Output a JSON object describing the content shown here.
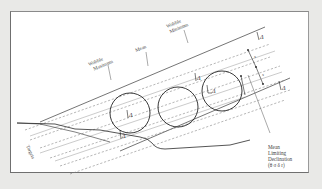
{
  "diagram": {
    "labels": {
      "wobble_maximum": [
        "Wobble",
        "Maximum"
      ],
      "mean": "Mean",
      "wobble_minimum": [
        "Wobble",
        "Minimum"
      ],
      "targets": "Targets",
      "mean_limiting_declination": [
        "Mean",
        "Limiting",
        "Declination",
        "(θ σ δ r)"
      ]
    },
    "symbols": {
      "delta": "Δ",
      "spacing": "s"
    },
    "circles": [
      {
        "cx": 130,
        "cy": 113,
        "r": 20
      },
      {
        "cx": 178,
        "cy": 107,
        "r": 20
      },
      {
        "cx": 222,
        "cy": 91,
        "r": 20
      }
    ],
    "colors": {
      "background": "#e9e9e7",
      "panel": "#ffffff",
      "line": "#2b2b2b",
      "dashed": "#7a7a7a"
    }
  }
}
